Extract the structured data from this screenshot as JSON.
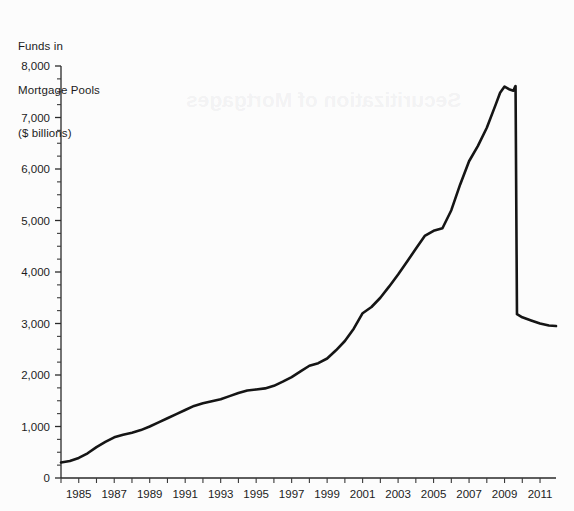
{
  "chart_data": {
    "type": "line",
    "title": "Funds in Mortgage Pools ($ billions)",
    "title_lines": [
      "Funds in",
      "Mortgage Pools",
      "($ billions)"
    ],
    "xlabel": "",
    "ylabel": "Funds in Mortgage Pools ($ billions)",
    "xlim": [
      1984,
      2011.9
    ],
    "ylim": [
      0,
      8000
    ],
    "ytick_values": [
      0,
      1000,
      2000,
      3000,
      4000,
      5000,
      6000,
      7000,
      8000
    ],
    "ytick_labels": [
      "0",
      "1,000",
      "2,000",
      "3,000",
      "4,000",
      "5,000",
      "6,000",
      "7,000",
      "8,000"
    ],
    "y_minor_interval": 250,
    "xtick_values": [
      1984,
      1985,
      1986,
      1987,
      1988,
      1989,
      1990,
      1991,
      1992,
      1993,
      1994,
      1995,
      1996,
      1997,
      1998,
      1999,
      2000,
      2001,
      2002,
      2003,
      2004,
      2005,
      2006,
      2007,
      2008,
      2009,
      2010,
      2011
    ],
    "xtick_labels": [
      "",
      "1985",
      "",
      "1987",
      "",
      "1989",
      "",
      "1991",
      "",
      "1993",
      "",
      "1995",
      "",
      "1997",
      "",
      "1999",
      "",
      "2001",
      "",
      "2003",
      "",
      "2005",
      "",
      "2007",
      "",
      "2009",
      "",
      "2011"
    ],
    "grid": false,
    "legend": "none",
    "line_color": "#151515",
    "axis_color": "#2a2a2a",
    "background_color": "#fcfcfc",
    "series": [
      {
        "name": "Funds in Mortgage Pools",
        "x": [
          1984,
          1984.5,
          1985,
          1985.5,
          1986,
          1986.5,
          1987,
          1987.5,
          1988,
          1988.5,
          1989,
          1989.5,
          1990,
          1990.5,
          1991,
          1991.5,
          1992,
          1992.5,
          1993,
          1993.5,
          1994,
          1994.5,
          1995,
          1995.5,
          1996,
          1996.5,
          1997,
          1997.5,
          1998,
          1998.5,
          1999,
          1999.5,
          2000,
          2000.5,
          2001,
          2001.5,
          2002,
          2002.5,
          2003,
          2003.5,
          2004,
          2004.5,
          2005,
          2005.5,
          2006,
          2006.5,
          2007,
          2007.5,
          2008,
          2008.5,
          2008.75,
          2009,
          2009.25,
          2009.5,
          2009.6,
          2009.62,
          2009.7,
          2010,
          2010.5,
          2011,
          2011.5,
          2011.9
        ],
        "values": [
          300,
          330,
          390,
          480,
          600,
          700,
          790,
          840,
          880,
          930,
          1000,
          1080,
          1160,
          1240,
          1320,
          1400,
          1450,
          1490,
          1530,
          1590,
          1650,
          1700,
          1720,
          1740,
          1790,
          1870,
          1960,
          2070,
          2180,
          2230,
          2320,
          2480,
          2660,
          2900,
          3200,
          3320,
          3500,
          3720,
          3950,
          4200,
          4450,
          4700,
          4800,
          4850,
          5200,
          5700,
          6150,
          6450,
          6800,
          7250,
          7480,
          7600,
          7550,
          7520,
          7600,
          7610,
          3180,
          3120,
          3060,
          3000,
          2960,
          2950
        ]
      }
    ]
  },
  "bleed_text": {
    "line1": "Securitization of Mortgages"
  }
}
